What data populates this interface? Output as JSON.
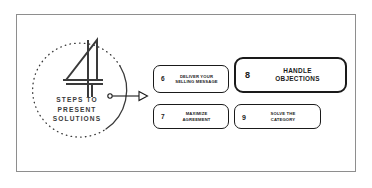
{
  "slide": {
    "background_color": "#ffffff",
    "frame_border_color": "#8e8e8e",
    "ink_color": "#1a1a1a",
    "caption_color": "#3a3a3a"
  },
  "hub": {
    "big_number": "4",
    "caption_line_1": "STEPS TO",
    "caption_line_2": "PRESENT",
    "caption_line_3": "SOLUTIONS",
    "circle_style": "half-dotted-half-solid",
    "connector": "dot-line-hollow-arrowhead"
  },
  "steps": [
    {
      "number": "6",
      "line_1": "DELIVER YOUR",
      "line_2": "SELLING MESSAGE",
      "highlighted": false
    },
    {
      "number": "7",
      "line_1": "MAXIMIZE",
      "line_2": "AGREEMENT",
      "highlighted": false
    },
    {
      "number": "8",
      "line_1": "HANDLE",
      "line_2": "OBJECTIONS",
      "highlighted": true
    },
    {
      "number": "9",
      "line_1": "SOLVE THE",
      "line_2": "CATEGORY",
      "highlighted": false
    }
  ]
}
